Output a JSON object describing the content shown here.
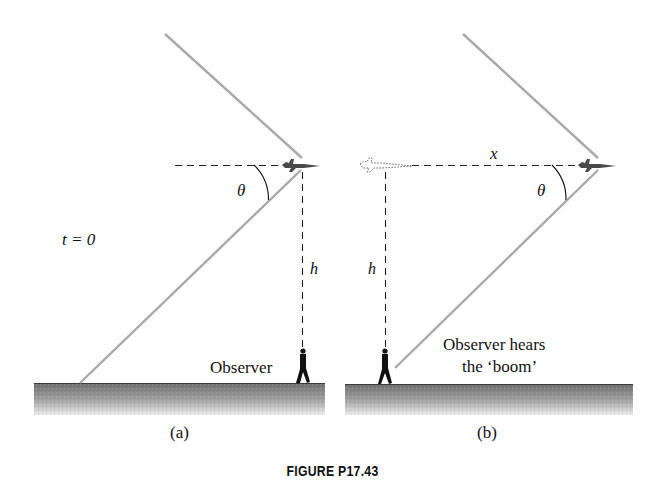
{
  "figure": {
    "caption": "FIGURE P17.43",
    "panel_a": {
      "label": "(a)",
      "time_label": "t = 0",
      "angle_label": "θ",
      "height_label": "h",
      "observer_label": "Observer"
    },
    "panel_b": {
      "label": "(b)",
      "distance_label": "x",
      "angle_label": "θ",
      "height_label": "h",
      "observer_label_line1": "Observer hears",
      "observer_label_line2": "the ‘boom’"
    },
    "colors": {
      "shock_line": "#a9a9a9",
      "dashed_line": "#222222",
      "ground_top": "#6f6f6f",
      "ground_bottom": "#e6e6e6",
      "plane": "#4a4a4a",
      "text": "#111111"
    }
  }
}
